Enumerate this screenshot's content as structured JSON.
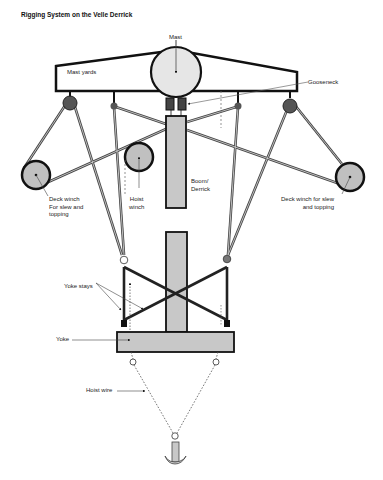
{
  "title": "Rigging System on the Velle Derrick",
  "labels": {
    "mast": "Mast",
    "mast_yards": "Mast yards",
    "gooseneck": "Gooseneck",
    "boom_line1": "Boom/",
    "boom_line2": "Derrick",
    "left_winch_line1": "Deck winch",
    "left_winch_line2": "For slew and",
    "left_winch_line3": "topping",
    "hoist_winch_line1": "Hoist",
    "hoist_winch_line2": "winch",
    "right_winch_line1": "Deck winch for slew",
    "right_winch_line2": "and topping",
    "yoke_stays": "Yoke stays",
    "yoke": "Yoke",
    "hoist_wire": "Hoist wire"
  },
  "colors": {
    "fill_gray": "#c8c8c8",
    "mast_fill": "#e6e6e6",
    "dark": "#4a4a4a",
    "stroke": "#111111"
  }
}
